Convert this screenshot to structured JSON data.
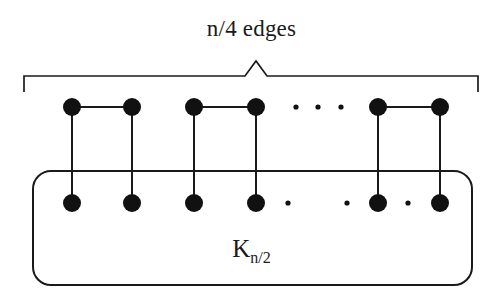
{
  "figure": {
    "type": "graph-diagram",
    "title": "n/4 edges",
    "clique_label_base": "K",
    "clique_label_subscript": "n/2",
    "clique_label_full": "K n/2",
    "stroke_color": "#1a1a1a",
    "node_color": "#111111",
    "background": "#ffffff",
    "width": 503,
    "height": 296
  },
  "brace": {
    "name": "n/4 edges",
    "x_start": 24,
    "x_end": 478,
    "bar_y": 76,
    "peak_x": 256,
    "peak_y": 61,
    "tick_bottom_y": 92
  },
  "clique_box": {
    "label": "K n/2",
    "x": 33,
    "y": 171,
    "width": 439,
    "height": 114,
    "corner_radius": 18
  },
  "nodes": {
    "radius": 9,
    "top_row_y": 107,
    "bottom_row_y": 203,
    "columns": [
      72,
      132,
      194,
      256,
      378,
      440
    ],
    "top": [
      {
        "id": "t1",
        "x": 72,
        "y": 107
      },
      {
        "id": "t2",
        "x": 132,
        "y": 107
      },
      {
        "id": "t3",
        "x": 194,
        "y": 107
      },
      {
        "id": "t4",
        "x": 256,
        "y": 107
      },
      {
        "id": "t5",
        "x": 378,
        "y": 107
      },
      {
        "id": "t6",
        "x": 440,
        "y": 107
      }
    ],
    "bottom": [
      {
        "id": "b1",
        "x": 72,
        "y": 203
      },
      {
        "id": "b2",
        "x": 132,
        "y": 203
      },
      {
        "id": "b3",
        "x": 194,
        "y": 203
      },
      {
        "id": "b4",
        "x": 256,
        "y": 203
      },
      {
        "id": "b5",
        "x": 378,
        "y": 203
      },
      {
        "id": "b6",
        "x": 440,
        "y": 203
      }
    ]
  },
  "edges": {
    "horizontal_top": [
      {
        "from": "t1",
        "to": "t2",
        "x1": 72,
        "x2": 132,
        "y": 107
      },
      {
        "from": "t3",
        "to": "t4",
        "x1": 194,
        "x2": 256,
        "y": 107
      },
      {
        "from": "t5",
        "to": "t6",
        "x1": 378,
        "x2": 440,
        "y": 107
      }
    ],
    "vertical": [
      {
        "from": "t1",
        "to": "b1",
        "x": 72,
        "y1": 107,
        "y2": 203
      },
      {
        "from": "t2",
        "to": "b2",
        "x": 132,
        "y1": 107,
        "y2": 203
      },
      {
        "from": "t3",
        "to": "b3",
        "x": 194,
        "y1": 107,
        "y2": 203
      },
      {
        "from": "t4",
        "to": "b4",
        "x": 256,
        "y1": 107,
        "y2": 203
      },
      {
        "from": "t5",
        "to": "b5",
        "x": 378,
        "y1": 107,
        "y2": 203
      },
      {
        "from": "t6",
        "to": "b6",
        "x": 440,
        "y1": 107,
        "y2": 203
      }
    ]
  },
  "ellipses": {
    "top_row": {
      "y": 107,
      "radius": 2.6,
      "x_positions": [
        296,
        318,
        341
      ]
    },
    "bottom_row": {
      "y": 203,
      "radius": 2.6,
      "x_positions": [
        288,
        347,
        408
      ]
    }
  },
  "chart_data": {
    "type": "diagram",
    "title": "n/4 edges",
    "annotations": [
      "n/4 edges",
      "K n/2"
    ],
    "visible_node_pairs": 3,
    "visible_top_nodes": 6,
    "visible_bottom_nodes": 6,
    "top_pair_edges": 3,
    "vertical_edges": 6,
    "ellipsis_groups": 2
  }
}
